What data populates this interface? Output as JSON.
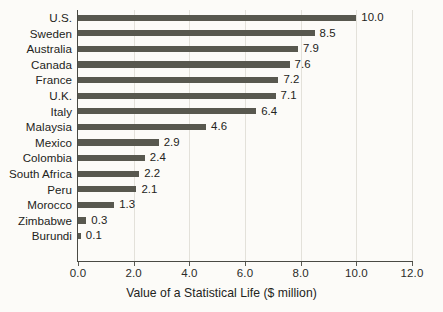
{
  "chart_data": {
    "type": "bar",
    "orientation": "horizontal",
    "title": "",
    "xlabel": "Value of a Statistical Life ($ million)",
    "ylabel": "",
    "xlim": [
      0.0,
      12.0
    ],
    "xticks": [
      "0.0",
      "2.0",
      "4.0",
      "6.0",
      "8.0",
      "10.0",
      "12.0"
    ],
    "xtick_values": [
      0.0,
      2.0,
      4.0,
      6.0,
      8.0,
      10.0,
      12.0
    ],
    "grid": "vertical",
    "legend": "none",
    "bar_color": "#58584f",
    "background_color": "#fcfbf8",
    "categories": [
      "U.S.",
      "Sweden",
      "Australia",
      "Canada",
      "France",
      "U.K.",
      "Italy",
      "Malaysia",
      "Mexico",
      "Colombia",
      "South Africa",
      "Peru",
      "Morocco",
      "Zimbabwe",
      "Burundi"
    ],
    "values": [
      10.0,
      8.5,
      7.9,
      7.6,
      7.2,
      7.1,
      6.4,
      4.6,
      2.9,
      2.4,
      2.2,
      2.1,
      1.3,
      0.3,
      0.1
    ],
    "value_labels": [
      "10.0",
      "8.5",
      "7.9",
      "7.6",
      "7.2",
      "7.1",
      "6.4",
      "4.6",
      "2.9",
      "2.4",
      "2.2",
      "2.1",
      "1.3",
      "0.3",
      "0.1"
    ]
  }
}
